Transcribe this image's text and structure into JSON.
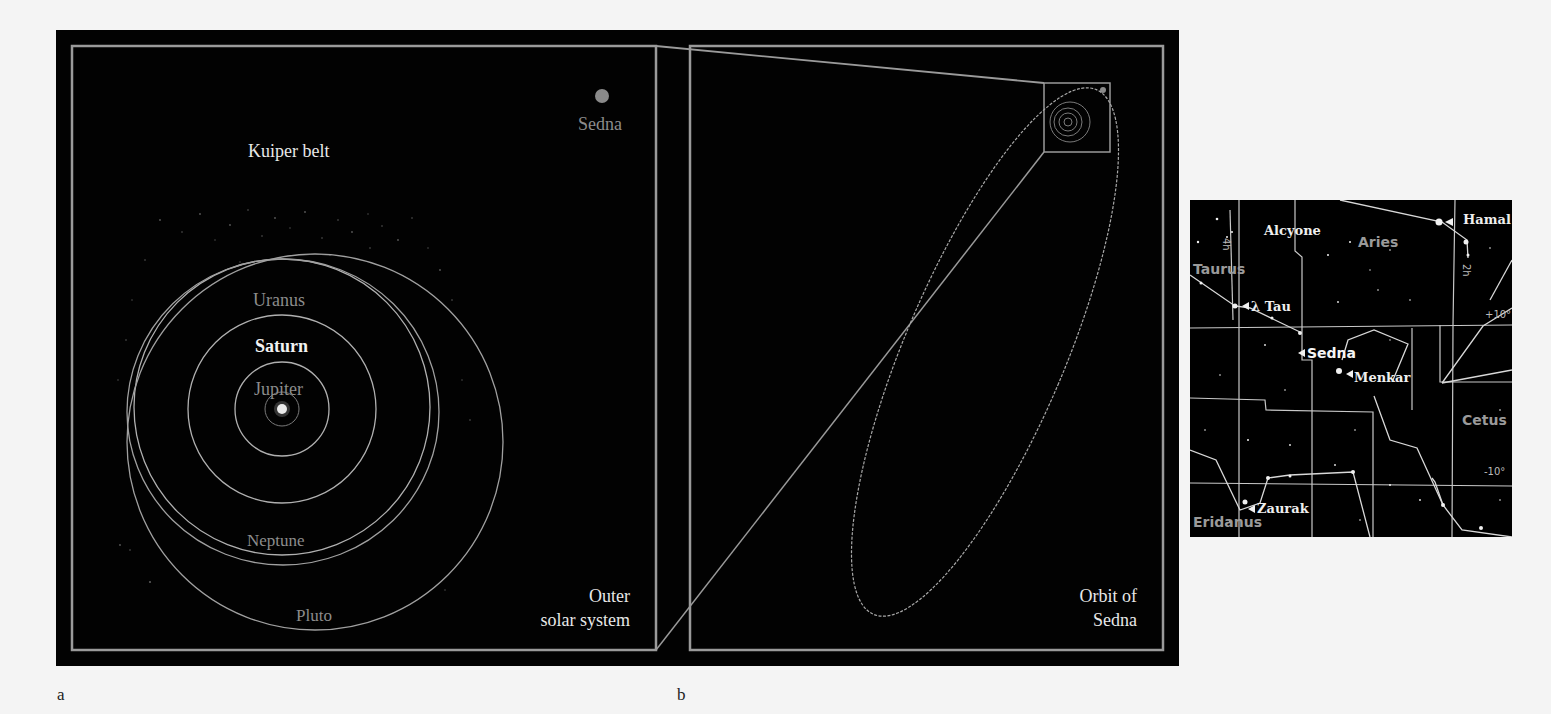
{
  "panel_a": {
    "letter": "a",
    "caption_line1": "Outer",
    "caption_line2": "solar system",
    "labels": {
      "kuiper_belt": "Kuiper belt",
      "sedna": "Sedna",
      "uranus": "Uranus",
      "saturn": "Saturn",
      "jupiter": "Jupiter",
      "neptune": "Neptune",
      "pluto": "Pluto"
    }
  },
  "panel_b": {
    "letter": "b",
    "caption_line1": "Orbit of",
    "caption_line2": "Sedna"
  },
  "star_chart": {
    "stars": {
      "hamal": "Hamal",
      "alcyone": "Alcyone",
      "lambda_tau": "λ Tau",
      "menkar": "Menkar",
      "zaurak": "Zaurak",
      "sedna": "Sedna"
    },
    "constellations": {
      "aries": "Aries",
      "taurus": "Taurus",
      "cetus": "Cetus",
      "eridanus": "Eridanus"
    },
    "grid": {
      "ra_4h": "4h",
      "ra_2h": "2h",
      "dec_plus10": "+10°",
      "dec_minus10": "-10°"
    }
  },
  "colors": {
    "background": "#f4f4f4",
    "panel_bg": "#020202",
    "frame_line": "#9a9a9a",
    "orbit_line": "#b0b0b0"
  }
}
